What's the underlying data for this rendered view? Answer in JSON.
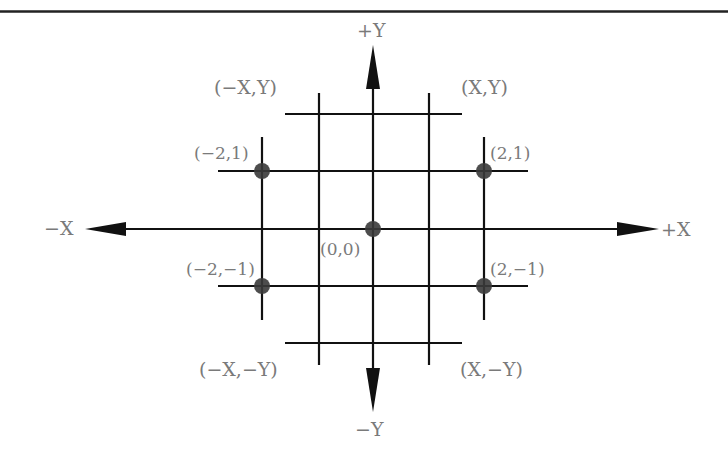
{
  "diagram": {
    "colors": {
      "line": "#111111",
      "label": "#7a7a7a",
      "point": "#3a3a3a",
      "rule": "#222222"
    },
    "axes": {
      "pos_x": "+X",
      "neg_x": "−X",
      "pos_y": "+Y",
      "neg_y": "−Y"
    },
    "quadrants": {
      "q1": "(X,Y)",
      "q2": "(−X,Y)",
      "q3": "(−X,−Y)",
      "q4": "(X,−Y)"
    },
    "points": [
      {
        "label": "(0,0)",
        "x": 0,
        "y": 0
      },
      {
        "label": "(−2,1)",
        "x": -2,
        "y": 1
      },
      {
        "label": "(2,1)",
        "x": 2,
        "y": 1
      },
      {
        "label": "(−2,−1)",
        "x": -2,
        "y": -1
      },
      {
        "label": "(2,−1)",
        "x": 2,
        "y": -1
      }
    ]
  }
}
